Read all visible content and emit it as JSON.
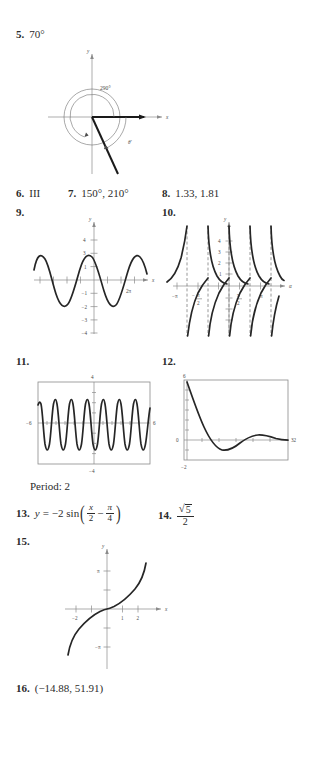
{
  "document": {
    "type": "textbook-answer-key",
    "page_background": "#ffffff",
    "ink_color": "#2b2b2b"
  },
  "answers": [
    {
      "number": "5.",
      "text": "70°"
    },
    {
      "number": "6.",
      "text": "III"
    },
    {
      "number": "7.",
      "text": "150°, 210°"
    },
    {
      "number": "8.",
      "text": "1.33, 1.81"
    },
    {
      "number": "9.",
      "text": ""
    },
    {
      "number": "10.",
      "text": ""
    },
    {
      "number": "11.",
      "text": ""
    },
    {
      "number": "12.",
      "text": ""
    },
    {
      "number": "13.",
      "text": "y = −2 sin(x/2 − π/4)"
    },
    {
      "number": "14.",
      "text": "√5 / 2"
    },
    {
      "number": "15.",
      "text": ""
    },
    {
      "number": "16.",
      "text": "(−14.88, 51.91)"
    }
  ],
  "item13": {
    "number": "13.",
    "lhs": "y",
    "equals": "=",
    "coefficient": "−2 sin",
    "frac1_num": "x",
    "frac1_den": "2",
    "minus": "−",
    "frac2_num": "π",
    "frac2_den": "4"
  },
  "item14": {
    "number": "14.",
    "radicand": "5",
    "denominator": "2"
  },
  "period_note": "Period: 2",
  "figures": {
    "fig5": {
      "name": "standard-position-angle-diagram",
      "axis_labels": {
        "x": "x",
        "y": "y"
      },
      "angle_main": "290°",
      "angle_reference": "θ′",
      "description": "290 degree angle drawn counterclockwise with reference angle 70 degrees in quadrant IV"
    },
    "fig9": {
      "name": "sine-curve-graph",
      "axis_labels": {
        "x": "x",
        "y": "y"
      },
      "y_ticks": [
        "4",
        "3",
        "1",
        "−1",
        "−2",
        "−3",
        "−4"
      ],
      "x_ticks": [
        "2π"
      ],
      "amplitude": 2,
      "description": "Sinusoid amplitude 2 over roughly -2pi to 2.6pi"
    },
    "fig10": {
      "name": "cotangent-curve-graph",
      "axis_labels": {
        "x": "α",
        "y": "y"
      },
      "y_ticks": [
        "4",
        "3",
        "2",
        "1"
      ],
      "x_ticks": [
        "−π",
        "−π/2",
        "π/2",
        "π"
      ],
      "x_tick_parts": [
        {
          "sign": "−",
          "num": "π",
          "den": ""
        },
        {
          "sign": "−",
          "num": "π",
          "den": "2"
        },
        {
          "sign": "",
          "num": "π",
          "den": "2"
        },
        {
          "sign": "",
          "num": "π",
          "den": ""
        }
      ],
      "description": "Cotangent-type branches with dashed vertical asymptotes"
    },
    "fig11": {
      "name": "calculator-window-oscillation",
      "window": {
        "xmin": "−6",
        "xmax": "6",
        "ymin": "−4",
        "ymax": "4"
      },
      "description": "Rapidly oscillating periodic curve, period 2"
    },
    "fig12": {
      "name": "calculator-window-damped-curve",
      "window": {
        "xmin": "0",
        "xmax": "32",
        "ymin": "−2",
        "ymax": "6"
      },
      "labels": {
        "left": "0",
        "right": "32",
        "top": "6",
        "bottom": "−2"
      },
      "description": "Damped decaying oscillation approaching zero"
    },
    "fig15": {
      "name": "inverse-function-graph",
      "axis_labels": {
        "x": "x",
        "y": "y"
      },
      "y_ticks": [
        "π",
        "−π"
      ],
      "x_ticks": [
        "−2",
        "1",
        "2"
      ],
      "description": "Increasing odd S-shaped curve through the origin"
    }
  }
}
